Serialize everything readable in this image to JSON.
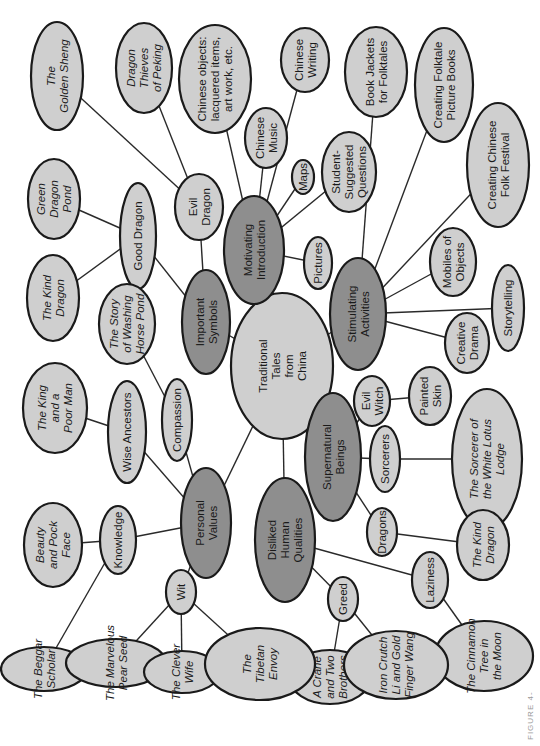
{
  "diagram": {
    "colors": {
      "leaf": "#cfcfcf",
      "hub": "#8e8e8e",
      "stroke": "#1a1a1a",
      "background": "#ffffff"
    },
    "caption": "FIGURE 4-",
    "nodes": [
      {
        "id": "center",
        "kind": "center",
        "lines": [
          "Traditional",
          "Tales",
          "from",
          "China"
        ],
        "italic": false,
        "cx": 282,
        "cy": 366,
        "rx": 73,
        "ry": 51
      },
      {
        "id": "motivating",
        "kind": "hub",
        "lines": [
          "Motivating",
          "Introduction"
        ],
        "italic": false,
        "cx": 254,
        "cy": 250,
        "rx": 54,
        "ry": 30
      },
      {
        "id": "important",
        "kind": "hub",
        "lines": [
          "Important",
          "Symbols"
        ],
        "italic": false,
        "cx": 206,
        "cy": 322,
        "rx": 52,
        "ry": 24
      },
      {
        "id": "stimulating",
        "kind": "hub",
        "lines": [
          "Stimulating",
          "Activities"
        ],
        "italic": false,
        "cx": 358,
        "cy": 314,
        "rx": 56,
        "ry": 28
      },
      {
        "id": "personal",
        "kind": "hub",
        "lines": [
          "Personal",
          "Values"
        ],
        "italic": false,
        "cx": 206,
        "cy": 523,
        "rx": 55,
        "ry": 25
      },
      {
        "id": "disliked",
        "kind": "hub",
        "lines": [
          "Disliked",
          "Human",
          "Qualities"
        ],
        "italic": false,
        "cx": 285,
        "cy": 540,
        "rx": 62,
        "ry": 30
      },
      {
        "id": "supernatural",
        "kind": "hub",
        "lines": [
          "Supernatural",
          "Beings"
        ],
        "italic": false,
        "cx": 333,
        "cy": 457,
        "rx": 64,
        "ry": 28
      },
      {
        "id": "golden",
        "kind": "leaf",
        "lines": [
          "The",
          "Golden Sheng"
        ],
        "italic": true,
        "cx": 57,
        "cy": 76,
        "rx": 54,
        "ry": 26
      },
      {
        "id": "thieves",
        "kind": "leaf",
        "lines": [
          "Dragon",
          "Thieves",
          "of Peking"
        ],
        "italic": true,
        "cx": 144,
        "cy": 68,
        "rx": 45,
        "ry": 28
      },
      {
        "id": "objects",
        "kind": "leaf",
        "lines": [
          "Chinese objects:",
          "lacquered items,",
          "art work, etc."
        ],
        "italic": false,
        "cx": 215,
        "cy": 79,
        "rx": 54,
        "ry": 36
      },
      {
        "id": "writing",
        "kind": "leaf",
        "lines": [
          "Chinese",
          "Writing"
        ],
        "italic": false,
        "cx": 305,
        "cy": 60,
        "rx": 32,
        "ry": 24
      },
      {
        "id": "music",
        "kind": "leaf",
        "lines": [
          "Chinese",
          "Music"
        ],
        "italic": false,
        "cx": 266,
        "cy": 138,
        "rx": 30,
        "ry": 21
      },
      {
        "id": "maps",
        "kind": "leaf",
        "lines": [
          "Maps"
        ],
        "italic": false,
        "cx": 303,
        "cy": 177,
        "rx": 17,
        "ry": 11
      },
      {
        "id": "student",
        "kind": "leaf",
        "lines": [
          "Student-",
          "Suggested",
          "Questions"
        ],
        "italic": false,
        "cx": 349,
        "cy": 172,
        "rx": 40,
        "ry": 27
      },
      {
        "id": "jackets",
        "kind": "leaf",
        "lines": [
          "Book Jackets",
          "for Folktales"
        ],
        "italic": false,
        "cx": 376,
        "cy": 72,
        "rx": 45,
        "ry": 31
      },
      {
        "id": "creatingbooks",
        "kind": "leaf",
        "lines": [
          "Creating Folktale",
          "Picture Books"
        ],
        "italic": false,
        "cx": 444,
        "cy": 85,
        "rx": 57,
        "ry": 29
      },
      {
        "id": "festival",
        "kind": "leaf",
        "lines": [
          "Creating Chinese",
          "Folk Festival"
        ],
        "italic": false,
        "cx": 498,
        "cy": 165,
        "rx": 62,
        "ry": 31
      },
      {
        "id": "pictures",
        "kind": "leaf",
        "lines": [
          "Pictures"
        ],
        "italic": false,
        "cx": 318,
        "cy": 263,
        "rx": 26,
        "ry": 14
      },
      {
        "id": "mobiles",
        "kind": "leaf",
        "lines": [
          "Mobiles of",
          "Objects"
        ],
        "italic": false,
        "cx": 453,
        "cy": 262,
        "rx": 34,
        "ry": 23
      },
      {
        "id": "storytelling",
        "kind": "leaf",
        "lines": [
          "Storytelling"
        ],
        "italic": false,
        "cx": 508,
        "cy": 308,
        "rx": 43,
        "ry": 16
      },
      {
        "id": "drama",
        "kind": "leaf",
        "lines": [
          "Creative",
          "Drama"
        ],
        "italic": false,
        "cx": 467,
        "cy": 343,
        "rx": 30,
        "ry": 22
      },
      {
        "id": "goodd",
        "kind": "leaf",
        "lines": [
          "Good Dragon"
        ],
        "italic": false,
        "cx": 138,
        "cy": 236,
        "rx": 53,
        "ry": 18
      },
      {
        "id": "evild",
        "kind": "leaf",
        "lines": [
          "Evil",
          "Dragon"
        ],
        "italic": false,
        "cx": 199,
        "cy": 207,
        "rx": 33,
        "ry": 24
      },
      {
        "id": "greenpond",
        "kind": "leaf",
        "lines": [
          "Green",
          "Dragon",
          "Pond"
        ],
        "italic": true,
        "cx": 54,
        "cy": 199,
        "rx": 40,
        "ry": 26
      },
      {
        "id": "kinddragon1",
        "kind": "leaf",
        "lines": [
          "The Kind",
          "Dragon"
        ],
        "italic": true,
        "cx": 53,
        "cy": 298,
        "rx": 43,
        "ry": 26
      },
      {
        "id": "washing",
        "kind": "leaf",
        "lines": [
          "The Story",
          "of Washing",
          "Horse Pond"
        ],
        "italic": true,
        "cx": 127,
        "cy": 324,
        "rx": 40,
        "ry": 28
      },
      {
        "id": "kingpoor",
        "kind": "leaf",
        "lines": [
          "The King",
          "and a",
          "Poor Man"
        ],
        "italic": true,
        "cx": 55,
        "cy": 408,
        "rx": 45,
        "ry": 32
      },
      {
        "id": "wise",
        "kind": "leaf",
        "lines": [
          "Wise Ancestors"
        ],
        "italic": false,
        "cx": 127,
        "cy": 432,
        "rx": 51,
        "ry": 19
      },
      {
        "id": "compassion",
        "kind": "leaf",
        "lines": [
          "Compassion"
        ],
        "italic": false,
        "cx": 177,
        "cy": 420,
        "rx": 41,
        "ry": 15
      },
      {
        "id": "evilwitch",
        "kind": "leaf",
        "lines": [
          "Evil",
          "Witch"
        ],
        "italic": false,
        "cx": 372,
        "cy": 401,
        "rx": 25,
        "ry": 18
      },
      {
        "id": "painted",
        "kind": "leaf",
        "lines": [
          "Painted",
          "Skin"
        ],
        "italic": false,
        "cx": 430,
        "cy": 396,
        "rx": 29,
        "ry": 21
      },
      {
        "id": "sorcerers",
        "kind": "leaf",
        "lines": [
          "Sorcerers"
        ],
        "italic": false,
        "cx": 385,
        "cy": 459,
        "rx": 33,
        "ry": 15
      },
      {
        "id": "whitelotus",
        "kind": "leaf",
        "lines": [
          "The Sorcerer of",
          "the White Lotus",
          "Lodge"
        ],
        "italic": true,
        "cx": 487,
        "cy": 459,
        "rx": 70,
        "ry": 35
      },
      {
        "id": "dragons",
        "kind": "leaf",
        "lines": [
          "Dragons"
        ],
        "italic": false,
        "cx": 382,
        "cy": 532,
        "rx": 24,
        "ry": 15
      },
      {
        "id": "kinddragon2",
        "kind": "leaf",
        "lines": [
          "The Kind",
          "Dragon"
        ],
        "italic": true,
        "cx": 483,
        "cy": 545,
        "rx": 35,
        "ry": 26
      },
      {
        "id": "laziness",
        "kind": "leaf",
        "lines": [
          "Laziness"
        ],
        "italic": false,
        "cx": 430,
        "cy": 580,
        "rx": 28,
        "ry": 18
      },
      {
        "id": "cinnamon",
        "kind": "leaf",
        "lines": [
          "The Cinnamon",
          "Tree in",
          "the Moon"
        ],
        "italic": true,
        "cx": 484,
        "cy": 656,
        "rx": 35,
        "ry": 49
      },
      {
        "id": "greed",
        "kind": "leaf",
        "lines": [
          "Greed"
        ],
        "italic": false,
        "cx": 343,
        "cy": 599,
        "rx": 22,
        "ry": 15
      },
      {
        "id": "crane",
        "kind": "leaf",
        "lines": [
          "A Crane",
          "and Two",
          "Brothers"
        ],
        "italic": true,
        "cx": 330,
        "cy": 677,
        "rx": 27,
        "ry": 41
      },
      {
        "id": "ironcrutch",
        "kind": "leaf",
        "lines": [
          "Iron Crutch",
          "Li and Gold",
          "Finger Wang"
        ],
        "italic": true,
        "cx": 396,
        "cy": 665,
        "rx": 34,
        "ry": 52
      },
      {
        "id": "knowledge",
        "kind": "leaf",
        "lines": [
          "Knowledge"
        ],
        "italic": false,
        "cx": 118,
        "cy": 540,
        "rx": 34,
        "ry": 18
      },
      {
        "id": "beauty",
        "kind": "leaf",
        "lines": [
          "Beauty",
          "and Pock",
          "Face"
        ],
        "italic": true,
        "cx": 53,
        "cy": 545,
        "rx": 42,
        "ry": 29
      },
      {
        "id": "wit",
        "kind": "leaf",
        "lines": [
          "Wit"
        ],
        "italic": false,
        "cx": 181,
        "cy": 592,
        "rx": 22,
        "ry": 15
      },
      {
        "id": "beggar",
        "kind": "leaf",
        "lines": [
          "The Beggar",
          "Scholar"
        ],
        "italic": true,
        "cx": 44,
        "cy": 669,
        "rx": 22,
        "ry": 43
      },
      {
        "id": "pearseed",
        "kind": "leaf",
        "lines": [
          "The Marvelous",
          "Pear Seed"
        ],
        "italic": true,
        "cx": 116,
        "cy": 663,
        "rx": 24,
        "ry": 50
      },
      {
        "id": "cleverwife",
        "kind": "leaf",
        "lines": [
          "The Clever",
          "Wife"
        ],
        "italic": true,
        "cx": 182,
        "cy": 672,
        "rx": 21,
        "ry": 38
      },
      {
        "id": "tibetan",
        "kind": "leaf",
        "lines": [
          "The",
          "Tibetan",
          "Envoy"
        ],
        "italic": true,
        "cx": 260,
        "cy": 664,
        "rx": 36,
        "ry": 55
      }
    ],
    "edges": [
      [
        "center",
        "motivating"
      ],
      [
        "center",
        "important"
      ],
      [
        "center",
        "stimulating"
      ],
      [
        "center",
        "personal"
      ],
      [
        "center",
        "disliked"
      ],
      [
        "center",
        "supernatural"
      ],
      [
        "motivating",
        "objects"
      ],
      [
        "motivating",
        "writing"
      ],
      [
        "motivating",
        "music"
      ],
      [
        "motivating",
        "maps"
      ],
      [
        "motivating",
        "student"
      ],
      [
        "motivating",
        "pictures"
      ],
      [
        "important",
        "goodd"
      ],
      [
        "important",
        "evild"
      ],
      [
        "goodd",
        "greenpond"
      ],
      [
        "goodd",
        "kinddragon1"
      ],
      [
        "evild",
        "golden"
      ],
      [
        "evild",
        "thieves"
      ],
      [
        "stimulating",
        "jackets"
      ],
      [
        "stimulating",
        "creatingbooks"
      ],
      [
        "stimulating",
        "festival"
      ],
      [
        "stimulating",
        "mobiles"
      ],
      [
        "stimulating",
        "storytelling"
      ],
      [
        "stimulating",
        "drama"
      ],
      [
        "personal",
        "wise"
      ],
      [
        "personal",
        "compassion"
      ],
      [
        "personal",
        "knowledge"
      ],
      [
        "personal",
        "wit"
      ],
      [
        "wise",
        "kingpoor"
      ],
      [
        "compassion",
        "washing"
      ],
      [
        "knowledge",
        "beauty"
      ],
      [
        "knowledge",
        "beggar"
      ],
      [
        "wit",
        "pearseed"
      ],
      [
        "wit",
        "cleverwife"
      ],
      [
        "wit",
        "tibetan"
      ],
      [
        "supernatural",
        "evilwitch"
      ],
      [
        "supernatural",
        "sorcerers"
      ],
      [
        "supernatural",
        "dragons"
      ],
      [
        "evilwitch",
        "painted"
      ],
      [
        "sorcerers",
        "whitelotus"
      ],
      [
        "dragons",
        "kinddragon2"
      ],
      [
        "disliked",
        "greed"
      ],
      [
        "disliked",
        "laziness"
      ],
      [
        "greed",
        "crane"
      ],
      [
        "greed",
        "ironcrutch"
      ],
      [
        "laziness",
        "cinnamon"
      ]
    ]
  }
}
